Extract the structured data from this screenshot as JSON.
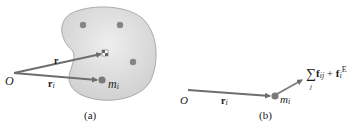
{
  "panel_a": {
    "caption": "(a)",
    "origin_label": "O",
    "vector_r_label": "r",
    "vector_ri_label": "r",
    "vector_ri_sub": "i",
    "mass_label": "m",
    "mass_sub": "i"
  },
  "panel_b": {
    "caption": "(b)",
    "origin_label": "O",
    "vector_ri_label": "r",
    "vector_ri_sub": "i",
    "mass_label": "m",
    "mass_sub": "i",
    "force_sum_symbol": "∑",
    "force_sum_index": "j",
    "force_internal": "f",
    "force_internal_sub": "ij",
    "plus": "+",
    "force_external": "f",
    "force_external_sub": "i",
    "force_external_sup": "E"
  },
  "colors": {
    "body_fill": "#d4d4d4",
    "body_stroke": "#9a9a9a",
    "arrow": "#6e6e6e",
    "dot": "#858585"
  }
}
